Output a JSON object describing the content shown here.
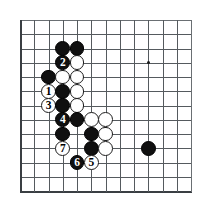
{
  "diagram": {
    "kind": "go-board-diagram",
    "board_size": 19,
    "visible_columns": 13,
    "visible_rows": 13,
    "corner": "top-left",
    "origin_x": 20,
    "origin_y": 20,
    "spacing": 14.25,
    "stone_radius": 7.4,
    "background_color": "#ffffff",
    "line_color": "#555a5e",
    "edge_color": "#3a3f43",
    "black_color": "#101010",
    "white_color": "#ffffff",
    "hoshi_points": [
      {
        "col": 9,
        "row": 3,
        "name": "star-point-upper-right"
      }
    ],
    "stones": [
      {
        "col": 3,
        "row": 2,
        "color": "black",
        "label": ""
      },
      {
        "col": 4,
        "row": 2,
        "color": "black",
        "label": ""
      },
      {
        "col": 2,
        "row": 4,
        "color": "black",
        "label": ""
      },
      {
        "col": 3,
        "row": 3,
        "color": "black",
        "label": "2"
      },
      {
        "col": 4,
        "row": 3,
        "color": "white",
        "label": ""
      },
      {
        "col": 3,
        "row": 4,
        "color": "white",
        "label": ""
      },
      {
        "col": 4,
        "row": 4,
        "color": "white",
        "label": ""
      },
      {
        "col": 2,
        "row": 5,
        "color": "white",
        "label": "1"
      },
      {
        "col": 3,
        "row": 5,
        "color": "black",
        "label": ""
      },
      {
        "col": 4,
        "row": 5,
        "color": "white",
        "label": ""
      },
      {
        "col": 2,
        "row": 6,
        "color": "white",
        "label": "3"
      },
      {
        "col": 3,
        "row": 6,
        "color": "black",
        "label": ""
      },
      {
        "col": 4,
        "row": 6,
        "color": "white",
        "label": ""
      },
      {
        "col": 3,
        "row": 7,
        "color": "black",
        "label": "4"
      },
      {
        "col": 4,
        "row": 7,
        "color": "black",
        "label": ""
      },
      {
        "col": 5,
        "row": 7,
        "color": "white",
        "label": ""
      },
      {
        "col": 6,
        "row": 7,
        "color": "white",
        "label": ""
      },
      {
        "col": 3,
        "row": 8,
        "color": "black",
        "label": ""
      },
      {
        "col": 5,
        "row": 8,
        "color": "black",
        "label": ""
      },
      {
        "col": 6,
        "row": 8,
        "color": "white",
        "label": ""
      },
      {
        "col": 3,
        "row": 9,
        "color": "white",
        "label": "7"
      },
      {
        "col": 5,
        "row": 9,
        "color": "black",
        "label": ""
      },
      {
        "col": 6,
        "row": 9,
        "color": "white",
        "label": ""
      },
      {
        "col": 4,
        "row": 10,
        "color": "black",
        "label": "6"
      },
      {
        "col": 5,
        "row": 10,
        "color": "white",
        "label": "5"
      },
      {
        "col": 9,
        "row": 9,
        "color": "black",
        "label": ""
      }
    ],
    "move_sequence": [
      {
        "number": "1",
        "color": "white",
        "col": 2,
        "row": 5
      },
      {
        "number": "2",
        "color": "black",
        "col": 3,
        "row": 3
      },
      {
        "number": "3",
        "color": "white",
        "col": 2,
        "row": 6
      },
      {
        "number": "4",
        "color": "black",
        "col": 3,
        "row": 7
      },
      {
        "number": "5",
        "color": "white",
        "col": 5,
        "row": 10
      },
      {
        "number": "6",
        "color": "black",
        "col": 4,
        "row": 10
      },
      {
        "number": "7",
        "color": "white",
        "col": 3,
        "row": 9
      }
    ]
  }
}
